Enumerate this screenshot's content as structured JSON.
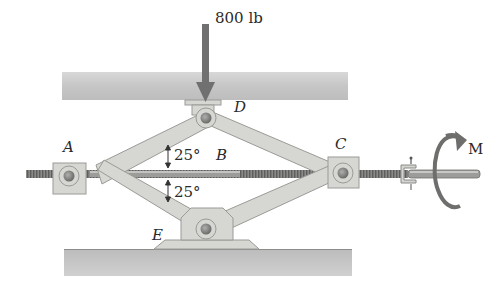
{
  "diagram": {
    "load": {
      "label": "800 lb",
      "direction": "down"
    },
    "points": [
      {
        "id": "A",
        "label": "A"
      },
      {
        "id": "B",
        "label": "B"
      },
      {
        "id": "C",
        "label": "C"
      },
      {
        "id": "D",
        "label": "D"
      },
      {
        "id": "E",
        "label": "E"
      }
    ],
    "angles": [
      {
        "label": "25°",
        "position": "above screw, at B-left"
      },
      {
        "label": "25°",
        "position": "below screw, at B-left"
      }
    ],
    "moment": {
      "label": "M",
      "direction": "rotational arrow about screw axis"
    },
    "colors": {
      "beam": "#c8c8c8",
      "link": "#d4d4d0",
      "link_edge": "#9a9a96",
      "pin": "#8a8a88",
      "screw": "#7c7c7a",
      "arrow": "#6e6e6c",
      "text": "#2a2a2a"
    }
  }
}
